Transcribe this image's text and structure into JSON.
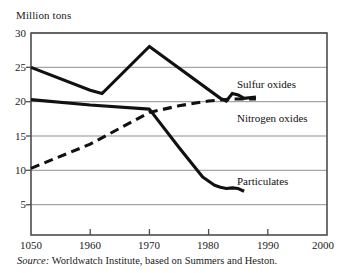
{
  "chart_data": {
    "type": "line",
    "title": "",
    "xlabel": "",
    "ylabel": "Million tons",
    "xlim": [
      1950,
      2000
    ],
    "ylim": [
      0,
      30
    ],
    "grid": "horizontal",
    "legend": "inline-annotations",
    "yticks": [
      30,
      25,
      20,
      15,
      10,
      5
    ],
    "ytick_labels": [
      "30",
      "25",
      "20",
      "15",
      "10",
      "5"
    ],
    "xticks": [
      1950,
      1960,
      1970,
      1980,
      1990,
      2000
    ],
    "xtick_labels": [
      "1050",
      "1960",
      "1970",
      "1980",
      "1990",
      "2000"
    ],
    "series": [
      {
        "name": "Sulfur oxides",
        "style": "solid",
        "color": "#111111",
        "x": [
          1950,
          1960,
          1962,
          1970,
          1982,
          1983,
          1984,
          1985,
          1986,
          1988
        ],
        "values": [
          24.9,
          21.5,
          21.0,
          28.0,
          20.3,
          19.9,
          21.0,
          20.8,
          20.3,
          20.5
        ]
      },
      {
        "name": "Nitrogen oxides",
        "style": "dashed",
        "color": "#111111",
        "x": [
          1950,
          1960,
          1970,
          1975,
          1980,
          1984,
          1988
        ],
        "values": [
          9.9,
          13.5,
          18.2,
          19.2,
          19.9,
          20.2,
          20.2
        ]
      },
      {
        "name": "Particulates",
        "style": "solid",
        "color": "#111111",
        "x": [
          1950,
          1960,
          1970,
          1975,
          1979,
          1981,
          1982,
          1983,
          1984,
          1985,
          1986
        ],
        "values": [
          20.1,
          19.3,
          18.7,
          13.0,
          8.6,
          7.4,
          7.1,
          6.9,
          7.0,
          6.9,
          6.5
        ]
      }
    ],
    "annotations": [
      {
        "text": "Sulfur oxides",
        "x": 1988,
        "y": 22.7
      },
      {
        "text": "Nitrogen oxides",
        "x": 1988,
        "y": 18.6
      },
      {
        "text": "Particulates",
        "x": 1987,
        "y": 7.3
      }
    ]
  },
  "caption": {
    "source_word": "Source:",
    "source_text": " Worldwatch Institute, based on Summers and Heston."
  },
  "colors": {
    "line": "#111111",
    "grid": "#9a9a9a",
    "frame": "#4d4d4d",
    "background": "#ffffff"
  }
}
